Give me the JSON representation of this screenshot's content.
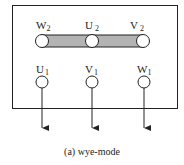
{
  "diagram": {
    "type": "terminal-box-wiring",
    "caption": "(a) wye-mode",
    "colors": {
      "stroke": "#222222",
      "link_bar": "#b3b3b3",
      "background": "#ffffff"
    },
    "top_terminals": [
      {
        "letter": "W",
        "sub": "2",
        "cx": 42
      },
      {
        "letter": "U",
        "sub": "2",
        "cx": 92
      },
      {
        "letter": "V",
        "sub": "2",
        "cx": 143
      }
    ],
    "bottom_terminals": [
      {
        "letter": "U",
        "sub": "1",
        "cx": 42
      },
      {
        "letter": "V",
        "sub": "1",
        "cx": 92
      },
      {
        "letter": "W",
        "sub": "1",
        "cx": 144
      }
    ],
    "link_bar": {
      "connects": [
        "W2",
        "U2",
        "V2"
      ],
      "label": "star-point link"
    },
    "leads": [
      "U1 lead",
      "V1 lead",
      "W1 lead"
    ]
  }
}
